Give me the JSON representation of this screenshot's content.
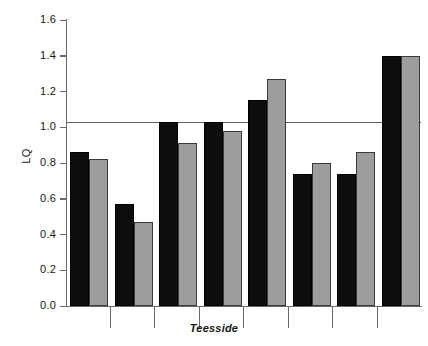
{
  "chart_data": {
    "type": "bar",
    "title": "",
    "xlabel": "Teesside",
    "ylabel": "LQ",
    "ylim": [
      0.0,
      1.6
    ],
    "ytick_labels": [
      "0.0",
      "0.2",
      "0.4",
      "0.6",
      "0.8",
      "1.0",
      "1.2",
      "1.4",
      "1.6"
    ],
    "ytick_values": [
      0.0,
      0.2,
      0.4,
      0.6,
      0.8,
      1.0,
      1.2,
      1.4,
      1.6
    ],
    "xtick_labels": [
      "",
      "",
      "",
      "",
      "",
      "",
      ""
    ],
    "grid": false,
    "legend": "none",
    "reference_line": 1.0,
    "categories": [
      "1",
      "2",
      "3",
      "4",
      "5",
      "6",
      "7",
      "8"
    ],
    "series": [
      {
        "name": "black",
        "color": "#0d0d0d",
        "values": [
          0.86,
          0.57,
          1.03,
          1.03,
          1.15,
          0.74,
          0.74,
          1.4
        ]
      },
      {
        "name": "grey",
        "color": "#9d9d9d",
        "values": [
          0.82,
          0.47,
          0.91,
          0.98,
          1.27,
          0.8,
          0.86,
          1.4
        ]
      }
    ]
  },
  "axes": {
    "y_title": "LQ",
    "x_title": "Teesside"
  }
}
